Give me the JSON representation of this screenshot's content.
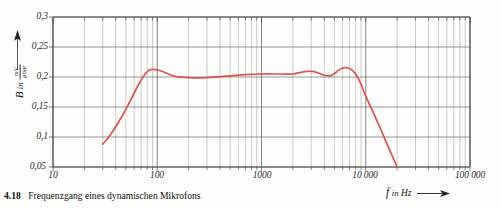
{
  "figure": {
    "caption_number": "4.18",
    "caption_text": "Frequenzgang eines dynamischen Mikrofons",
    "curve_color": "#d9534f",
    "grid_color": "#6f6f6f",
    "minor_grid_color": "#8d8d8d"
  },
  "axes": {
    "y_title_symbol": "B",
    "y_title_in": "in",
    "y_unit_numerator": "mV",
    "y_unit_denominator": "µbar",
    "y_arrow": "up-arrow",
    "x_title_symbol": "f",
    "x_title_in": "in",
    "x_unit": "Hz",
    "x_arrow": "right-arrow",
    "y_ticks": [
      "0,05",
      "0,1",
      "0,15",
      "0,2",
      "0,25",
      "0,3"
    ],
    "y_tick_values": [
      0.05,
      0.1,
      0.15,
      0.2,
      0.25,
      0.3
    ],
    "x_ticks": [
      "10",
      "100",
      "1000",
      "10 000",
      "100 000"
    ],
    "x_tick_values": [
      10,
      100,
      1000,
      10000,
      100000
    ]
  },
  "chart_data": {
    "type": "line",
    "title": "Frequenzgang eines dynamischen Mikrofons",
    "xlabel": "f in Hz",
    "ylabel": "B in mV/µbar",
    "xscale": "log",
    "yscale": "linear",
    "xlim": [
      10,
      100000
    ],
    "ylim": [
      0.05,
      0.3
    ],
    "grid": true,
    "legend": "none",
    "series": [
      {
        "name": "Dynamisches Mikrofon — Frequenzgang",
        "color": "#d9534f",
        "points": [
          [
            30,
            0.088
          ],
          [
            36,
            0.105
          ],
          [
            45,
            0.132
          ],
          [
            55,
            0.16
          ],
          [
            65,
            0.185
          ],
          [
            75,
            0.203
          ],
          [
            85,
            0.212
          ],
          [
            100,
            0.212
          ],
          [
            120,
            0.207
          ],
          [
            150,
            0.201
          ],
          [
            200,
            0.199
          ],
          [
            300,
            0.199
          ],
          [
            500,
            0.202
          ],
          [
            700,
            0.204
          ],
          [
            1000,
            0.205
          ],
          [
            1500,
            0.205
          ],
          [
            2000,
            0.205
          ],
          [
            2600,
            0.209
          ],
          [
            3200,
            0.209
          ],
          [
            4000,
            0.203
          ],
          [
            4600,
            0.202
          ],
          [
            5200,
            0.208
          ],
          [
            6000,
            0.215
          ],
          [
            7000,
            0.214
          ],
          [
            8000,
            0.205
          ],
          [
            9000,
            0.188
          ],
          [
            10000,
            0.168
          ],
          [
            12000,
            0.138
          ],
          [
            14000,
            0.112
          ],
          [
            16000,
            0.088
          ],
          [
            18000,
            0.068
          ],
          [
            20000,
            0.05
          ]
        ]
      }
    ]
  }
}
